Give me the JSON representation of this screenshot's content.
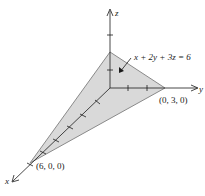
{
  "diagram": {
    "type": "3d-plane-intercepts",
    "equation": "x + 2y + 3z = 6",
    "axes": {
      "x_label": "x",
      "y_label": "y",
      "z_label": "z"
    },
    "vertices": {
      "x_intercept": "(6, 0, 0)",
      "y_intercept": "(0, 3, 0)"
    },
    "colors": {
      "plane_fill": "#d9d9d9",
      "plane_edge": "#8a8a8a",
      "axis": "#1a1a1a",
      "background": "#ffffff"
    }
  }
}
